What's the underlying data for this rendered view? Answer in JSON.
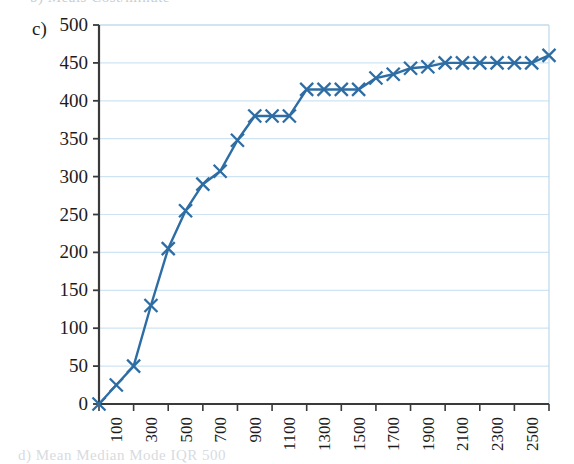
{
  "part_label": "c)",
  "top_clipped_text": "b)  Meals      Cost/minute",
  "bottom_clipped_text": "d)  Mean  Median    Mode   IQR    500",
  "colors": {
    "series": "#2e6da4",
    "gridline": "#cfe4f2",
    "axis": "#3a3a3a",
    "plot_border": "#bcd9ea",
    "text": "#1c1c1c"
  },
  "chart_data": {
    "type": "line",
    "title": "",
    "xlabel": "",
    "ylabel": "",
    "xlim": [
      0,
      2600
    ],
    "ylim": [
      0,
      500
    ],
    "ytick_step": 50,
    "grid": true,
    "legend": "none",
    "marker": "x",
    "ytick_labels": [
      "0",
      "50",
      "100",
      "150",
      "200",
      "250",
      "300",
      "350",
      "400",
      "450",
      "500"
    ],
    "ytick_values": [
      0,
      50,
      100,
      150,
      200,
      250,
      300,
      350,
      400,
      450,
      500
    ],
    "xtick_labels": [
      "100",
      "300",
      "500",
      "700",
      "900",
      "1100",
      "1300",
      "1500",
      "1700",
      "1900",
      "2100",
      "2300",
      "2500"
    ],
    "xtick_values": [
      100,
      300,
      500,
      700,
      900,
      1100,
      1300,
      1500,
      1700,
      1900,
      2100,
      2300,
      2500
    ],
    "xtick_rotation": -90,
    "x": [
      0,
      100,
      200,
      300,
      400,
      500,
      600,
      700,
      800,
      900,
      1000,
      1100,
      1200,
      1300,
      1400,
      1500,
      1600,
      1700,
      1800,
      1900,
      2000,
      2100,
      2200,
      2300,
      2400,
      2500,
      2600
    ],
    "values": [
      0,
      25,
      50,
      130,
      205,
      255,
      290,
      307,
      348,
      380,
      380,
      380,
      415,
      415,
      415,
      415,
      430,
      435,
      443,
      445,
      450,
      450,
      450,
      450,
      450,
      450,
      460
    ],
    "series": [
      {
        "name": "cumulative frequency",
        "values": [
          0,
          25,
          50,
          130,
          205,
          255,
          290,
          307,
          348,
          380,
          380,
          380,
          415,
          415,
          415,
          415,
          430,
          435,
          443,
          445,
          450,
          450,
          450,
          450,
          450,
          450,
          460
        ]
      }
    ]
  }
}
